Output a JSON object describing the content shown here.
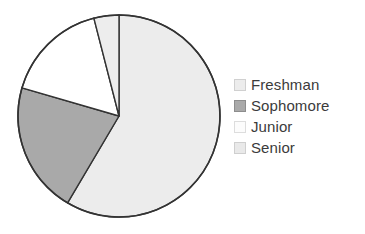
{
  "chart_data": {
    "type": "pie",
    "title": "",
    "subtitle": "",
    "labels": [
      "Freshman",
      "Sophomore",
      "Junior",
      "Senior"
    ],
    "values": [
      58.5,
      21.0,
      16.5,
      4.0
    ],
    "units": "percent",
    "start_angle_deg": 0,
    "direction": "clockwise",
    "slice_colors": [
      "#ececec",
      "#a9a9a9",
      "#ffffff",
      "#ededed"
    ],
    "slice_edge_color": "#333333",
    "legend_position": "right",
    "grid": false,
    "xlabel": "",
    "ylabel": "",
    "slices": [
      {
        "label": "Freshman",
        "value": 58.5,
        "color": "#ececec",
        "start_deg": 0.0,
        "end_deg": 210.6
      },
      {
        "label": "Sophomore",
        "value": 21.0,
        "color": "#a9a9a9",
        "start_deg": 210.6,
        "end_deg": 286.2
      },
      {
        "label": "Junior",
        "value": 16.5,
        "color": "#ffffff",
        "start_deg": 286.2,
        "end_deg": 345.6
      },
      {
        "label": "Senior",
        "value": 4.0,
        "color": "#ededed",
        "start_deg": 345.6,
        "end_deg": 360.0
      }
    ]
  },
  "legend": {
    "items": [
      {
        "label": "Freshman",
        "color": "#ececec",
        "border": "#d0d0d0"
      },
      {
        "label": "Sophomore",
        "color": "#a9a9a9",
        "border": "#8d8d8d"
      },
      {
        "label": "Junior",
        "color": "#fcfcfc",
        "border": "#dddddd"
      },
      {
        "label": "Senior",
        "color": "#e9e9e9",
        "border": "#cfcfcf"
      }
    ]
  },
  "geometry": {
    "center_x": 109,
    "center_y": 110,
    "radius": 101
  }
}
